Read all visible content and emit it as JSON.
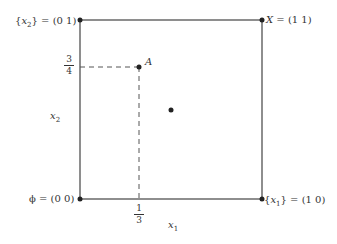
{
  "diagram": {
    "type": "unit-square",
    "corners": [
      {
        "id": "phi",
        "label_set": "ϕ",
        "label_coord": "(0 0)",
        "x": 0,
        "y": 0
      },
      {
        "id": "x1",
        "label_set": "x",
        "label_sub": "1",
        "label_coord": "(1 0)",
        "x": 1,
        "y": 0
      },
      {
        "id": "x2",
        "label_set": "x",
        "label_sub": "2",
        "label_coord": "(0 1)",
        "x": 0,
        "y": 1
      },
      {
        "id": "X",
        "label_set": "X",
        "label_coord": "(1 1)",
        "x": 1,
        "y": 1
      }
    ],
    "point_A": {
      "label": "A",
      "x": "1/3",
      "y": "3/4"
    },
    "center_point": {
      "x": 0.5,
      "y": 0.5
    },
    "axis_x": {
      "symbol": "x",
      "sub": "1"
    },
    "axis_y": {
      "symbol": "x",
      "sub": "2"
    },
    "tick_x": {
      "num": "1",
      "den": "3"
    },
    "tick_y": {
      "num": "3",
      "den": "4"
    },
    "eq": "="
  }
}
